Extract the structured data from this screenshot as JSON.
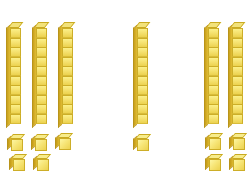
{
  "scene": {
    "title": "Base-ten blocks",
    "background_color": "#ffffff",
    "block_color": "#f5e271",
    "block_edge_color": "#cdae28",
    "block_shadow_color": "#c8a01c",
    "width": 250,
    "height": 176
  },
  "legend": {
    "rod_name": "tens-rod",
    "rod_value": "10",
    "cube_name": "unit-cube",
    "cube_value": "1",
    "rod_segments": "10"
  },
  "groups": [
    {
      "id": "group-left",
      "label": "Group 1",
      "rods": 3,
      "cubes": 5,
      "tens_value": "30",
      "ones_value": "5",
      "total": "35",
      "left": 0,
      "rod_positions": [
        6,
        32,
        58
      ],
      "cube_positions": [
        {
          "x": 7,
          "y": 134
        },
        {
          "x": 31,
          "y": 134
        },
        {
          "x": 55,
          "y": 133
        },
        {
          "x": 9,
          "y": 154
        },
        {
          "x": 33,
          "y": 154
        }
      ]
    },
    {
      "id": "group-middle",
      "label": "Group 2",
      "rods": 1,
      "cubes": 1,
      "tens_value": "10",
      "ones_value": "1",
      "total": "11",
      "left": 0,
      "rod_positions": [
        133
      ],
      "cube_positions": [
        {
          "x": 133,
          "y": 134
        }
      ]
    },
    {
      "id": "group-right",
      "label": "Group 3",
      "rods": 2,
      "cubes": 4,
      "tens_value": "20",
      "ones_value": "4",
      "total": "24",
      "left": 0,
      "rod_positions": [
        204,
        228
      ],
      "cube_positions": [
        {
          "x": 205,
          "y": 133
        },
        {
          "x": 229,
          "y": 133
        },
        {
          "x": 205,
          "y": 154
        },
        {
          "x": 229,
          "y": 154
        }
      ]
    }
  ],
  "totals": {
    "rods_total": "6",
    "cubes_total": "10",
    "grand_total": "70"
  }
}
